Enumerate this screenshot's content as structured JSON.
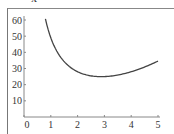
{
  "top_label": "x²",
  "chart_data": {
    "type": "line",
    "title": "",
    "xlabel": "",
    "ylabel": "",
    "function_hint": "x^2 + 48/x",
    "x": [
      0.8,
      1,
      1.5,
      2,
      2.5,
      3,
      3.5,
      4,
      4.5,
      5
    ],
    "values": [
      60.6,
      49,
      34.3,
      28,
      25.45,
      25,
      25.96,
      28,
      30.92,
      34.6
    ],
    "xlim": [
      0,
      5
    ],
    "ylim": [
      0,
      62
    ],
    "xticks": [
      "0",
      "1",
      "2",
      "3",
      "4",
      "5"
    ],
    "yticks": [
      "10",
      "20",
      "30",
      "40",
      "50",
      "60"
    ],
    "grid": false,
    "legend": null
  },
  "colors": {
    "curve": "#444444",
    "axis": "#777777",
    "text": "#333333"
  }
}
